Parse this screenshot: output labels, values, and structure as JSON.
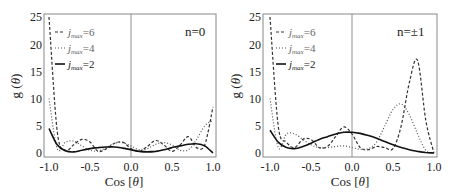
{
  "chart_data": [
    {
      "type": "line",
      "panel_label": "n=0",
      "xlabel": "Cos [θ]",
      "ylabel": "g (θ)",
      "xlim": [
        -1.0,
        1.0
      ],
      "ylim": [
        0,
        25
      ],
      "xticks": [
        "-1.0",
        "-0.5",
        "0.0",
        "0.5",
        "1.0"
      ],
      "yticks": [
        "0",
        "5",
        "10",
        "15",
        "20",
        "25"
      ],
      "legend": [
        "j_max=6",
        "j_max=4",
        "j_max=2"
      ],
      "legend_position": "upper left",
      "x": [
        -1.0,
        -0.9,
        -0.8,
        -0.7,
        -0.6,
        -0.5,
        -0.4,
        -0.3,
        -0.2,
        -0.1,
        0.0,
        0.1,
        0.2,
        0.3,
        0.4,
        0.5,
        0.6,
        0.7,
        0.8,
        0.9,
        1.0
      ],
      "series": [
        {
          "name": "j_max=6",
          "style": "dashed",
          "values": [
            25.0,
            4.0,
            0.5,
            1.5,
            2.5,
            2.0,
            0.3,
            0.8,
            1.8,
            2.0,
            0.8,
            0.3,
            1.2,
            2.3,
            1.5,
            0.3,
            1.5,
            3.0,
            1.0,
            1.5,
            8.5
          ]
        },
        {
          "name": "j_max=4",
          "style": "dotted",
          "values": [
            10.0,
            0.8,
            2.0,
            2.2,
            1.3,
            0.5,
            0.4,
            1.0,
            1.8,
            1.9,
            1.3,
            0.6,
            0.8,
            1.6,
            1.9,
            1.5,
            0.5,
            0.6,
            2.5,
            5.0,
            6.0
          ]
        },
        {
          "name": "j_max=2",
          "style": "solid",
          "values": [
            4.5,
            1.5,
            0.4,
            0.2,
            0.5,
            0.8,
            1.0,
            1.1,
            1.1,
            0.9,
            0.6,
            0.3,
            0.2,
            0.3,
            0.6,
            1.0,
            1.3,
            1.6,
            1.7,
            1.3,
            0.0
          ]
        }
      ]
    },
    {
      "type": "line",
      "panel_label": "n=±1",
      "xlabel": "Cos [θ]",
      "ylabel": "g (θ)",
      "xlim": [
        -1.0,
        1.0
      ],
      "ylim": [
        0,
        25
      ],
      "xticks": [
        "-1.0",
        "-0.5",
        "0.0",
        "0.5",
        "1.0"
      ],
      "yticks": [
        "0",
        "5",
        "10",
        "15",
        "20",
        "25"
      ],
      "legend": [
        "j_max=6",
        "j_max=4",
        "j_max=2"
      ],
      "legend_position": "upper left",
      "x": [
        -1.0,
        -0.9,
        -0.8,
        -0.7,
        -0.6,
        -0.5,
        -0.4,
        -0.3,
        -0.2,
        -0.1,
        0.0,
        0.1,
        0.2,
        0.3,
        0.4,
        0.5,
        0.6,
        0.7,
        0.8,
        0.9,
        1.0
      ],
      "series": [
        {
          "name": "j_max=6",
          "style": "dashed",
          "values": [
            25.0,
            5.0,
            2.0,
            1.0,
            2.5,
            2.5,
            1.0,
            1.2,
            3.0,
            4.8,
            3.5,
            1.0,
            0.6,
            1.2,
            1.0,
            0.8,
            5.0,
            13.0,
            17.0,
            6.0,
            0.0
          ]
        },
        {
          "name": "j_max=4",
          "style": "dotted",
          "values": [
            10.0,
            1.0,
            3.5,
            3.5,
            2.5,
            1.5,
            1.0,
            1.0,
            1.2,
            1.3,
            1.0,
            0.7,
            0.8,
            2.0,
            5.0,
            8.0,
            9.0,
            7.0,
            3.5,
            0.5,
            0.0
          ]
        },
        {
          "name": "j_max=2",
          "style": "solid",
          "values": [
            4.2,
            2.0,
            1.0,
            0.8,
            1.2,
            1.8,
            2.5,
            3.0,
            3.5,
            3.8,
            3.8,
            3.6,
            3.2,
            2.7,
            2.1,
            1.5,
            1.0,
            0.6,
            0.3,
            0.1,
            0.0
          ]
        }
      ]
    }
  ],
  "panels": [
    {
      "label": "n=0",
      "ylabel_main": "g (",
      "ylabel_theta": "θ",
      "ylabel_end": ")",
      "xlabel_main": "Cos [",
      "xlabel_theta": "θ",
      "xlabel_end": "]",
      "legend": [
        {
          "j": "j",
          "sub": "max",
          "val": "=6"
        },
        {
          "j": "j",
          "sub": "max",
          "val": "=4"
        },
        {
          "j": "j",
          "sub": "max",
          "val": "=2"
        }
      ],
      "xticks": [
        "-1.0",
        "-0.5",
        "0.0",
        "0.5",
        "1.0"
      ],
      "yticks": [
        "0",
        "5",
        "10",
        "15",
        "20",
        "25"
      ]
    },
    {
      "label": "n=±1",
      "ylabel_main": "g (",
      "ylabel_theta": "θ",
      "ylabel_end": ")",
      "xlabel_main": "Cos [",
      "xlabel_theta": "θ",
      "xlabel_end": "]",
      "legend": [
        {
          "j": "j",
          "sub": "max",
          "val": "=6"
        },
        {
          "j": "j",
          "sub": "max",
          "val": "=4"
        },
        {
          "j": "j",
          "sub": "max",
          "val": "=2"
        }
      ],
      "xticks": [
        "-1.0",
        "-0.5",
        "0.0",
        "0.5",
        "1.0"
      ],
      "yticks": [
        "0",
        "5",
        "10",
        "15",
        "20",
        "25"
      ]
    }
  ],
  "colors": {
    "solid": "#111111",
    "dashed": "#333333",
    "dotted": "#555555",
    "axis": "#888888"
  }
}
